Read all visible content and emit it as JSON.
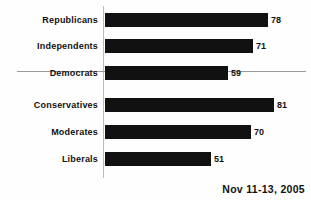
{
  "chart_data": {
    "type": "bar",
    "orientation": "horizontal",
    "title": "",
    "subtitle": "",
    "xlabel": "",
    "ylabel": "",
    "categories": [
      "Republicans",
      "Independents",
      "Democrats",
      "Conservatives",
      "Moderates",
      "Liberals"
    ],
    "values": [
      78,
      71,
      59,
      81,
      70,
      51
    ],
    "xlim": [
      0,
      81
    ],
    "grid": false,
    "legend": null,
    "bar_color": "#111111",
    "axis_color": "#b9b9b9",
    "separator_color": "#9a9a9a",
    "groups": [
      {
        "name": "party",
        "categories": [
          "Republicans",
          "Independents",
          "Democrats"
        ]
      },
      {
        "name": "ideology",
        "categories": [
          "Conservatives",
          "Moderates",
          "Liberals"
        ]
      }
    ],
    "annotations": [
      "Nov 11-13, 2005"
    ],
    "bars": [
      {
        "label": "Republicans",
        "value": 78,
        "value_label": "78"
      },
      {
        "label": "Independents",
        "value": 71,
        "value_label": "71"
      },
      {
        "label": "Democrats",
        "value": 59,
        "value_label": "59"
      },
      {
        "label": "Conservatives",
        "value": 81,
        "value_label": "81"
      },
      {
        "label": "Moderates",
        "value": 70,
        "value_label": "70"
      },
      {
        "label": "Liberals",
        "value": 51,
        "value_label": "51"
      }
    ]
  },
  "footnote": {
    "date_text": "Nov 11-13, 2005"
  }
}
